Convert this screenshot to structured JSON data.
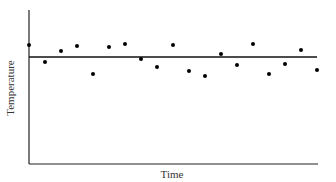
{
  "chart_data": {
    "type": "scatter",
    "title": "",
    "xlabel": "Time",
    "ylabel": "Temperature",
    "grid": false,
    "legend": null,
    "x": [
      1,
      2,
      3,
      4,
      5,
      6,
      7,
      8,
      9,
      10,
      11,
      12,
      13,
      14,
      15,
      16,
      17,
      18,
      19
    ],
    "values": [
      7.5,
      6.4,
      7.1,
      7.4,
      5.6,
      7.4,
      7.6,
      6.6,
      6.1,
      7.5,
      5.8,
      5.5,
      6.9,
      6.2,
      7.6,
      5.6,
      6.3,
      7.2,
      5.8
    ],
    "mean_line": 6.7,
    "ylim": [
      0,
      10
    ],
    "points_px": [
      [
        29,
        45
      ],
      [
        45,
        62
      ],
      [
        61,
        51
      ],
      [
        77,
        46
      ],
      [
        93,
        74
      ],
      [
        109,
        47
      ],
      [
        125,
        44
      ],
      [
        141,
        59
      ],
      [
        157,
        67
      ],
      [
        173,
        45
      ],
      [
        189,
        71
      ],
      [
        205,
        76
      ],
      [
        221,
        54
      ],
      [
        237,
        65
      ],
      [
        253,
        44
      ],
      [
        269,
        74
      ],
      [
        285,
        64
      ],
      [
        301,
        50
      ],
      [
        317,
        70
      ]
    ],
    "mean_line_px": {
      "x1": 29,
      "x2": 317,
      "y": 57
    }
  },
  "labels": {
    "x": "Time",
    "y": "Temperature"
  },
  "colors": {
    "axis": "#222222",
    "points": "#000000",
    "line": "#111111"
  }
}
